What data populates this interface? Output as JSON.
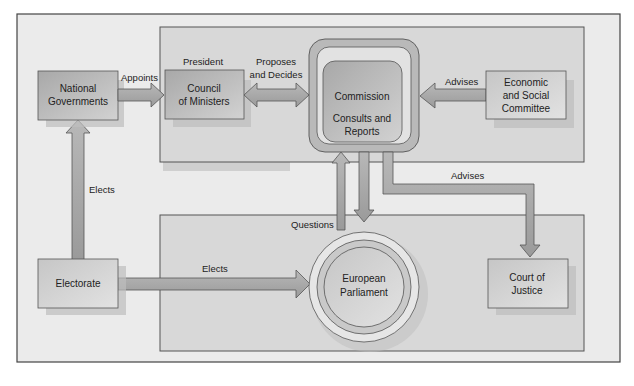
{
  "diagram": {
    "nodes": {
      "national_governments": {
        "line1": "National",
        "line2": "Governments"
      },
      "council": {
        "line1": "Council",
        "line2": "of Ministers",
        "header": "President"
      },
      "commission": {
        "title": "Commission",
        "line1": "Consults and",
        "line2": "Reports"
      },
      "esc": {
        "line1": "Economic",
        "line2": "and Social",
        "line3": "Committee"
      },
      "electorate": {
        "label": "Electorate"
      },
      "parliament": {
        "line1": "European",
        "line2": "Parliament"
      },
      "court": {
        "line1": "Court of",
        "line2": "Justice"
      }
    },
    "edges": {
      "appoints": "Appoints",
      "proposes1": "Proposes",
      "proposes2": "and Decides",
      "advises_esc": "Advises",
      "advises_court": "Advises",
      "elects_gov": "Elects",
      "elects_parl": "Elects",
      "questions": "Questions"
    },
    "colors": {
      "frame_bg": "#e8e8e8",
      "panel_bg": "#d6d6d6",
      "box_fill": "#c4c4c4",
      "arrow_fill": "#a9a9a9",
      "stroke": "#555555"
    }
  }
}
